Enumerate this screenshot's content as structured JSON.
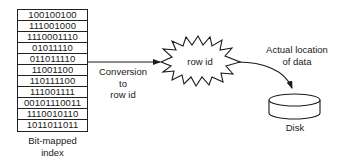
{
  "bitmap_index": {
    "rows": [
      "100100100",
      "111001000",
      "1110001110",
      "01011110",
      "011011110",
      "11001100",
      "110111100",
      "111001111",
      "00101110011",
      "1110010110",
      "1011011011"
    ],
    "caption_line1": "Bit-mapped",
    "caption_line2": "index"
  },
  "conversion_label": {
    "line1": "Conversion",
    "line2": "to",
    "line3": "row id"
  },
  "row_id_node": {
    "label": "row id",
    "shape": "starburst"
  },
  "location_label": {
    "line1": "Actual location",
    "line2": "of data"
  },
  "disk": {
    "label": "Disk",
    "shape": "cylinder"
  },
  "colors": {
    "stroke": "#1a1a1a",
    "background": "#ffffff"
  }
}
